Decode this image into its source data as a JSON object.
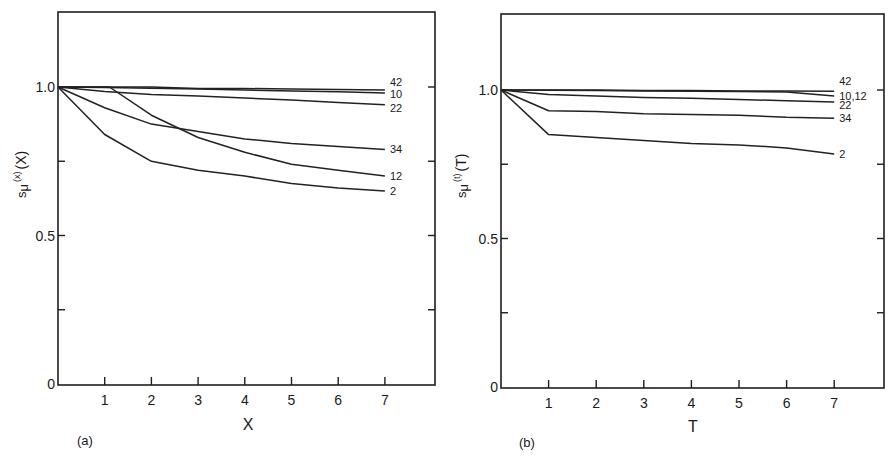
{
  "figure": {
    "panels": [
      {
        "id": "a",
        "panel_tag": "(a)",
        "xlabel": "X",
        "ylabel": "sμ(x)(X)",
        "ylabel_parts": {
          "base": "s",
          "sub": "μ",
          "sup": "(x)",
          "arg": "(X)"
        },
        "frame": {
          "left": 58,
          "top": 12,
          "right": 435,
          "bottom": 385
        },
        "map": {
          "x0": 58,
          "x_per_unit": 46.7,
          "y0": 384,
          "y_per_unit": 297
        },
        "x_ticks": [
          1,
          2,
          3,
          4,
          5,
          6,
          7
        ],
        "y_ticks": [
          {
            "v": 0,
            "label": "0"
          },
          {
            "v": 0.25,
            "label": ""
          },
          {
            "v": 0.5,
            "label": "0.5"
          },
          {
            "v": 0.75,
            "label": ""
          },
          {
            "v": 1.0,
            "label": "1.0"
          }
        ],
        "tag_pos": {
          "x": 77,
          "y": 445
        },
        "xlabel_pos": {
          "x": 248,
          "y": 430
        }
      },
      {
        "id": "b",
        "panel_tag": "(b)",
        "xlabel": "T",
        "ylabel": "sμ(t)(T)",
        "ylabel_parts": {
          "base": "s",
          "sub": "μ",
          "sup": "(t)",
          "arg": "(T)"
        },
        "frame": {
          "left": 501,
          "top": 14,
          "right": 884,
          "bottom": 388
        },
        "map": {
          "x0": 501,
          "x_per_unit": 47.6,
          "y0": 387,
          "y_per_unit": 297
        },
        "x_ticks": [
          1,
          2,
          3,
          4,
          5,
          6,
          7
        ],
        "y_ticks": [
          {
            "v": 0,
            "label": "0"
          },
          {
            "v": 0.25,
            "label": ""
          },
          {
            "v": 0.5,
            "label": "0.5"
          },
          {
            "v": 0.75,
            "label": ""
          },
          {
            "v": 1.0,
            "label": "1.0"
          }
        ],
        "tag_pos": {
          "x": 519,
          "y": 447
        },
        "xlabel_pos": {
          "x": 693,
          "y": 432
        }
      }
    ]
  },
  "chart_data": [
    {
      "type": "line",
      "title": "(a)",
      "xlabel": "X",
      "ylabel": "sμ(x)(X)",
      "xlim": [
        0,
        8
      ],
      "ylim": [
        0,
        1.25
      ],
      "x_ticks": [
        1,
        2,
        3,
        4,
        5,
        6,
        7
      ],
      "y_tick_labels": [
        "0",
        "0.5",
        "1.0"
      ],
      "grid": false,
      "legend": "inline labels at right end of curves",
      "series": [
        {
          "name": "42",
          "x": [
            0,
            1,
            2,
            3,
            4,
            5,
            6,
            7
          ],
          "values": [
            1.0,
            1.0,
            1.0,
            0.995,
            0.995,
            0.993,
            0.992,
            0.99
          ],
          "label_dy": -4
        },
        {
          "name": "10",
          "x": [
            0,
            1,
            2,
            3,
            4,
            5,
            6,
            7
          ],
          "values": [
            1.0,
            0.998,
            0.996,
            0.993,
            0.99,
            0.987,
            0.984,
            0.98
          ],
          "label_dy": 5
        },
        {
          "name": "22",
          "x": [
            0,
            1,
            2,
            3,
            4,
            5,
            6,
            7
          ],
          "values": [
            1.0,
            0.985,
            0.975,
            0.97,
            0.963,
            0.956,
            0.948,
            0.94
          ],
          "label_dy": 7
        },
        {
          "name": "34",
          "x": [
            0,
            1,
            2,
            3,
            4,
            5,
            6,
            7
          ],
          "values": [
            1.0,
            0.93,
            0.875,
            0.85,
            0.825,
            0.81,
            0.8,
            0.79
          ],
          "label_dy": 4
        },
        {
          "name": "12",
          "x": [
            0,
            1.1,
            2,
            3,
            4,
            5,
            6,
            7
          ],
          "values": [
            1.0,
            1.0,
            0.905,
            0.83,
            0.78,
            0.74,
            0.72,
            0.7
          ],
          "label_dy": 4
        },
        {
          "name": "2",
          "x": [
            0,
            1,
            2,
            3,
            4,
            5,
            6,
            7
          ],
          "values": [
            1.0,
            0.84,
            0.75,
            0.72,
            0.7,
            0.675,
            0.66,
            0.65
          ],
          "label_dy": 4
        }
      ]
    },
    {
      "type": "line",
      "title": "(b)",
      "xlabel": "T",
      "ylabel": "sμ(t)(T)",
      "xlim": [
        0,
        8
      ],
      "ylim": [
        0,
        1.25
      ],
      "x_ticks": [
        1,
        2,
        3,
        4,
        5,
        6,
        7
      ],
      "y_tick_labels": [
        "0",
        "0.5",
        "1.0"
      ],
      "grid": false,
      "legend": "inline labels at right end of curves",
      "series": [
        {
          "name": "42",
          "x": [
            0,
            1,
            2,
            3,
            4,
            5,
            6,
            7
          ],
          "values": [
            1.0,
            1.0,
            1.0,
            0.998,
            0.998,
            0.997,
            0.997,
            0.996
          ],
          "label_dy": -6
        },
        {
          "name": "10,12",
          "x": [
            0,
            1,
            2,
            3,
            4,
            5,
            6,
            7
          ],
          "values": [
            1.0,
            0.999,
            0.998,
            0.997,
            0.996,
            0.995,
            0.993,
            0.98
          ],
          "label_dy": 4
        },
        {
          "name": "22",
          "x": [
            0,
            1,
            2,
            3,
            4,
            5,
            6,
            7
          ],
          "values": [
            1.0,
            0.985,
            0.98,
            0.975,
            0.972,
            0.968,
            0.964,
            0.96
          ],
          "label_dy": 7
        },
        {
          "name": "34",
          "x": [
            0,
            1,
            2,
            3,
            4,
            5,
            6,
            7
          ],
          "values": [
            1.0,
            0.93,
            0.928,
            0.92,
            0.918,
            0.915,
            0.908,
            0.905
          ],
          "label_dy": 4
        },
        {
          "name": "2",
          "x": [
            0,
            1,
            2,
            3,
            4,
            5,
            6,
            7
          ],
          "values": [
            1.0,
            0.85,
            0.84,
            0.83,
            0.82,
            0.815,
            0.805,
            0.785
          ],
          "label_dy": 4
        }
      ]
    }
  ]
}
